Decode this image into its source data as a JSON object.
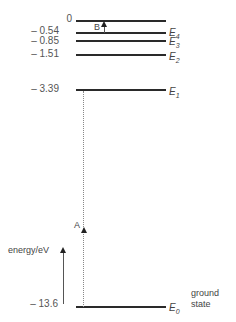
{
  "diagram": {
    "type": "energy-level-diagram",
    "axis_label": "energy/eV",
    "levels": [
      {
        "name": "top",
        "value": "0",
        "label": "",
        "y": 20
      },
      {
        "name": "E4",
        "value": "– 0.54",
        "label": "E",
        "sub": "4",
        "y": 32
      },
      {
        "name": "E3",
        "value": "– 0.85",
        "label": "E",
        "sub": "3",
        "y": 40
      },
      {
        "name": "E2",
        "value": "– 1.51",
        "label": "E",
        "sub": "2",
        "y": 54
      },
      {
        "name": "E1",
        "value": "– 3.39",
        "label": "E",
        "sub": "1",
        "y": 89
      },
      {
        "name": "E0",
        "value": "– 13.6",
        "label": "E",
        "sub": "0",
        "y": 306
      }
    ],
    "ground_state_label_1": "ground",
    "ground_state_label_2": "state",
    "transitions": [
      {
        "label": "A",
        "from": "E0",
        "to": "E1",
        "style": "dotted"
      },
      {
        "label": "B",
        "from": "E4",
        "to": "0",
        "style": "solid"
      }
    ]
  }
}
